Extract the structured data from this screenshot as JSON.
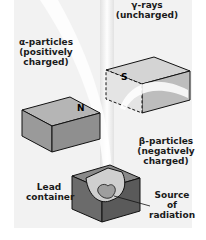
{
  "figure": {
    "labels": {
      "gamma": "γ-rays\n(uncharged)",
      "alpha": "α-particles\n(positively\ncharged)",
      "beta": "β-particles\n(negatively\ncharged)",
      "lead": "Lead\ncontainer",
      "source": "Source\nof\nradiation",
      "north_pole": "N",
      "south_pole": "S"
    },
    "colors": {
      "background": "#f2f2f2",
      "magnet_top": "#b5b5b5",
      "magnet_side": "#8f8f8f",
      "lead_dark": "#6b6b6b",
      "beam": "#ffffff",
      "outline": "#111111"
    }
  }
}
